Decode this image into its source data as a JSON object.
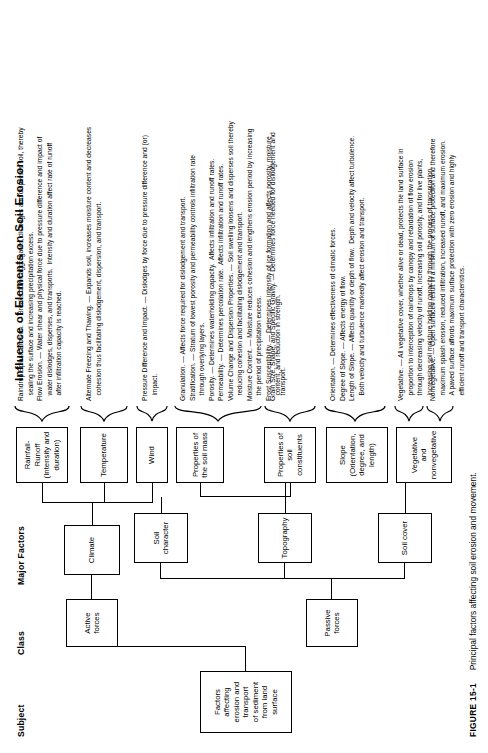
{
  "figure": {
    "title": "Influence of Elements on Soil Erosion",
    "caption_number": "FIGURE 15-1",
    "caption_text": "Principal factors affecting soil erosion and movement."
  },
  "columns": [
    {
      "key": "subject",
      "label": "Subject"
    },
    {
      "key": "class",
      "label": "Class"
    },
    {
      "key": "major_factors",
      "label": "Major Factors"
    },
    {
      "key": "elements",
      "label": "Elements"
    },
    {
      "key": "influence",
      "label": "Influence of Elements on Soil Erosion"
    }
  ],
  "subject": {
    "label": "Factors\naffecting\nerosion and\ntransport\nof sediment\nfrom land\nsurface"
  },
  "classes": [
    {
      "id": "active",
      "label": "Active\nforces"
    },
    {
      "id": "passive",
      "label": "Passive\nforces"
    }
  ],
  "major_factors": [
    {
      "id": "climate",
      "label": "Climate",
      "class": "active"
    },
    {
      "id": "soil-character",
      "label": "Soil\ncharacter",
      "class": "passive"
    },
    {
      "id": "topography",
      "label": "Topography",
      "class": "passive"
    },
    {
      "id": "soil-cover",
      "label": "Soil cover",
      "class": "passive"
    }
  ],
  "elements": [
    {
      "id": "rainfall-runoff",
      "label": "Rainfall-Runoff\n(Intensity and\nduration)",
      "factor": "climate"
    },
    {
      "id": "temperature",
      "label": "Temperature",
      "factor": "climate"
    },
    {
      "id": "wind",
      "label": "Wind",
      "factor": "climate"
    },
    {
      "id": "properties-soil-mass",
      "label": "Properties of\nthe soil mass",
      "factor": "soil-character"
    },
    {
      "id": "properties-soil-constituents",
      "label": "Properties of\nsoil constituents",
      "factor": "soil-character"
    },
    {
      "id": "slope",
      "label": "Slope\n(Orientation,\ndegree, and\nlength)",
      "factor": "topography"
    },
    {
      "id": "vegetative-nonvegetative",
      "label": "Vegetative and\nnonvegetative",
      "factor": "soil-cover"
    }
  ],
  "influences": [
    {
      "id": "inf-rainfall-runoff",
      "element": "rainfall-runoff",
      "text": "Raindrop Splash Erosion. — Breaks down aggregates, dislodges and disperses soil, thereby\n   sealing the surface and increasing precipitation excess.\nFlow Erosion. — Water shear and physical force due to pressure difference and impact of\n   water dislodges, disperses, and transports.  Intensity and duration affect rate of runoff\n   after infiltration capacity is reached."
    },
    {
      "id": "inf-temperature",
      "element": "temperature",
      "text": "Alternate Freezing and Thawing. — Expands soil, increases moisture content and decreases\n   cohesion thus facilitating dislodgement, dispersion, and transport."
    },
    {
      "id": "inf-wind",
      "element": "wind",
      "text": "Pressure Difference and Impact. — Dislodges by force due to pressure difference and (or)\n   impact."
    },
    {
      "id": "inf-soil-mass-constituents",
      "element": "properties-soil-mass",
      "text": "Granulation. — Affects force required for dislodgement and transport.\nStratification. — Stratum of lowest porosity and permeability controls infiltration rate\n   through overlying layers.\nPorosity. — Determines waterholding capacity.  Affects infiltration and runoff rates.\nPermeability. — Determines percolation rate.  Affects infiltration and runoff rates.\nVolume Change and Dispersion Properties. — Soil swelling loosens and disperses soil thereby\n   reducing cohesion and facilitating dislodgement and transport.\nMoisture Content. — Moisture reduces cohesion and lengthens erosion period by increasing\n   the period of precipitation excess.\nFrost Susceptibility. — Determines intensity of ice formation and affects porosity, moisture\n   content, and reduction in strength."
    },
    {
      "id": "inf-soil-constituents",
      "element": "properties-soil-constituents",
      "text": "Grain Size, Shape, and Specific Gravity. — Determines force needed for dislodgement and\n   transport."
    },
    {
      "id": "inf-slope",
      "element": "slope",
      "text": "Orientation. — Determines effectiveness of climatic forces.\nDegree of Slope. — Affects energy of flow.\nLength of Slope. — Affects quantity or depth of flow.  Depth and velocity affect turbulence.\n   Both velocity and turbulence markedly affect erosion and transport."
    },
    {
      "id": "inf-vegetative",
      "element": "vegetative-nonvegetative",
      "text": "Vegetative. — All vegetative cover, whether alive or dead, protects the land surface in\n   proportion to interception of raindrops by canopy and retardation of flow erosion\n   through decreasing velocity of runoff, increasing soil porosity, and for live plants,\n   increasing soil moisture holding capacity through the process of transpiration."
    },
    {
      "id": "inf-nonvegetative",
      "element": "vegetative-nonvegetative",
      "text": "Nonvegetative. — Open surfaces result in a minimum of surface protection and therefore\n   maximum splash erosion, reduced infiltration, increased runoff, and maximum erosion.\n   A paved surface affords maximum surface protection with zero erosion and highly\n   efficient runoff and transport characteristics."
    }
  ]
}
